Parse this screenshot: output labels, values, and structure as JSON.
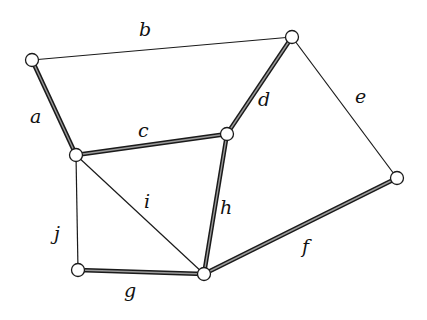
{
  "diagram": {
    "type": "graph",
    "nodes": [
      {
        "id": "v1",
        "x": 32,
        "y": 60
      },
      {
        "id": "v2",
        "x": 292,
        "y": 37
      },
      {
        "id": "v3",
        "x": 76,
        "y": 155
      },
      {
        "id": "v4",
        "x": 227,
        "y": 134
      },
      {
        "id": "v5",
        "x": 397,
        "y": 178
      },
      {
        "id": "v6",
        "x": 78,
        "y": 270
      },
      {
        "id": "v7",
        "x": 204,
        "y": 274
      }
    ],
    "edges": [
      {
        "label": "a",
        "from": "v1",
        "to": "v3",
        "thick": true
      },
      {
        "label": "b",
        "from": "v1",
        "to": "v2",
        "thick": false
      },
      {
        "label": "c",
        "from": "v3",
        "to": "v4",
        "thick": true
      },
      {
        "label": "d",
        "from": "v4",
        "to": "v2",
        "thick": true
      },
      {
        "label": "e",
        "from": "v2",
        "to": "v5",
        "thick": false
      },
      {
        "label": "f",
        "from": "v7",
        "to": "v5",
        "thick": true
      },
      {
        "label": "g",
        "from": "v6",
        "to": "v7",
        "thick": true
      },
      {
        "label": "h",
        "from": "v4",
        "to": "v7",
        "thick": true
      },
      {
        "label": "i",
        "from": "v3",
        "to": "v7",
        "thick": false
      },
      {
        "label": "j",
        "from": "v3",
        "to": "v6",
        "thick": false
      }
    ],
    "labels": {
      "a": "a",
      "b": "b",
      "c": "c",
      "d": "d",
      "e": "e",
      "f": "f",
      "g": "g",
      "h": "h",
      "i": "i",
      "j": "j"
    }
  }
}
